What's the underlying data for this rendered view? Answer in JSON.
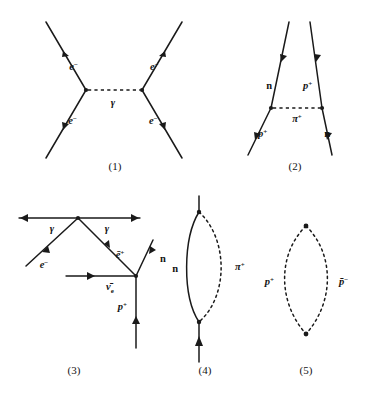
{
  "figure": {
    "background_color": "#ffffff",
    "ink_color": "#1a1a1a"
  },
  "diagrams": [
    {
      "id": "diagram-1",
      "caption": "(1)",
      "description": "Electron-electron scattering via photon exchange",
      "exchange_particle": "γ",
      "labels": {
        "upper_left": "e",
        "upper_left_charge": "−",
        "upper_right": "e",
        "upper_right_charge": "−",
        "lower_left": "e",
        "lower_left_charge": "−",
        "lower_right": "e",
        "lower_right_charge": "−",
        "mediator": "γ"
      }
    },
    {
      "id": "diagram-2",
      "caption": "(2)",
      "description": "Neutron-proton scattering via charged pion exchange",
      "exchange_particle": "π",
      "labels": {
        "upper_left": "n",
        "upper_right": "p",
        "upper_right_charge": "+",
        "lower_left": "p",
        "lower_left_charge": "+",
        "lower_right": "n",
        "mediator": "π",
        "mediator_charge": "+"
      }
    },
    {
      "id": "diagram-3",
      "caption": "(3)",
      "description": "Multi-vertex diagram with two photons, electron, positron, antineutrino, neutron and proton",
      "labels": {
        "photon_left": "γ",
        "photon_right": "γ",
        "electron": "e",
        "electron_charge": "−",
        "positron": "ē",
        "positron_charge": "+",
        "antineutrino": "ν̄",
        "antineutrino_sub": "e",
        "neutron": "n",
        "proton": "p",
        "proton_charge": "+"
      }
    },
    {
      "id": "diagram-4",
      "caption": "(4)",
      "description": "Self-energy loop: neutron line emitting and reabsorbing a pion",
      "labels": {
        "solid_branch": "n",
        "dashed_branch": "π",
        "dashed_branch_charge": "+"
      }
    },
    {
      "id": "diagram-5",
      "caption": "(5)",
      "description": "Closed dashed loop of proton and antiproton",
      "labels": {
        "left_branch": "p",
        "left_branch_charge": "+",
        "right_branch": "p̄",
        "right_branch_charge": "−"
      }
    }
  ]
}
